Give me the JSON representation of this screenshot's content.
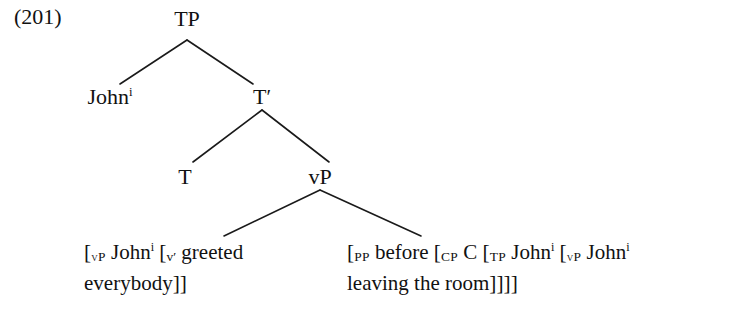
{
  "figure": {
    "example_number": "(201)",
    "background_color": "#ffffff",
    "ink_color": "#111111"
  },
  "tree": {
    "nodes": [
      {
        "id": "tp",
        "label": "TP",
        "x": 187,
        "y": 18
      },
      {
        "id": "john",
        "label": "John",
        "index": "i",
        "x": 110,
        "y": 86
      },
      {
        "id": "tbar",
        "label": "T",
        "prime": "′",
        "x": 262,
        "y": 86
      },
      {
        "id": "t",
        "label": "T",
        "x": 185,
        "y": 166
      },
      {
        "id": "vp",
        "label": "vP",
        "x": 320,
        "y": 166
      }
    ],
    "edges": [
      {
        "from": "tp",
        "to": "john",
        "x1": 187,
        "y1": 40,
        "x2": 120,
        "y2": 84
      },
      {
        "from": "tp",
        "to": "tbar",
        "x1": 187,
        "y1": 40,
        "x2": 253,
        "y2": 84
      },
      {
        "from": "tbar",
        "to": "t",
        "x1": 262,
        "y1": 110,
        "x2": 193,
        "y2": 162
      },
      {
        "from": "tbar",
        "to": "vp",
        "x1": 262,
        "y1": 110,
        "x2": 329,
        "y2": 162
      },
      {
        "from": "vp",
        "to": "leaf-left",
        "x1": 320,
        "y1": 190,
        "x2": 224,
        "y2": 236
      },
      {
        "from": "vp",
        "to": "leaf-right",
        "x1": 320,
        "y1": 190,
        "x2": 421,
        "y2": 236
      }
    ],
    "line_color": "#1a1a1a",
    "line_width": 1.6
  },
  "leaves": {
    "left": {
      "line1": {
        "open_bracket_1": "[",
        "label_1": "vP",
        "word_1": "John",
        "index_1": "i",
        "open_bracket_2": "[",
        "label_2": "v′",
        "word_2": "greeted"
      },
      "line2": {
        "word_3": "everybody",
        "close_brackets": "]]"
      },
      "plain_text": "[vP Johni [v′ greeted everybody]]"
    },
    "right": {
      "line1": {
        "open_bracket_1": "[",
        "label_1": "PP",
        "word_1": "before",
        "open_bracket_2": "[",
        "label_2": "CP",
        "word_2": "C",
        "open_bracket_3": "[",
        "label_3": "TP",
        "word_3": "John",
        "index_3": "i",
        "open_bracket_4": "[",
        "label_4": "vP",
        "word_4": "John",
        "index_4": "i"
      },
      "line2": {
        "word_5": "leaving the room",
        "close_brackets": "]]]]"
      },
      "plain_text": "[PP before [CP C [TP Johni [vP Johni leaving the room]]]]"
    }
  }
}
